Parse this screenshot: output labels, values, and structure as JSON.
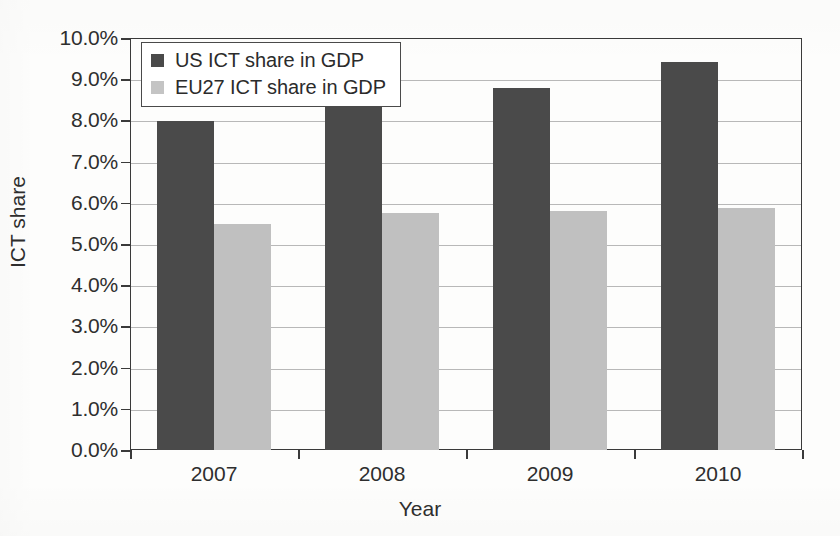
{
  "chart_data": {
    "type": "bar",
    "title": "",
    "subtitle": "",
    "xlabel": "Year",
    "ylabel": "ICT share",
    "categories": [
      "2007",
      "2008",
      "2009",
      "2010"
    ],
    "series": [
      {
        "name": "US ICT share in GDP",
        "color": "#4a4a4a",
        "values": [
          8.0,
          8.5,
          8.8,
          9.45
        ]
      },
      {
        "name": "EU27 ICT share in GDP",
        "color": "#c0c0c0",
        "values": [
          5.5,
          5.78,
          5.83,
          5.9
        ]
      }
    ],
    "ylim": [
      0,
      10
    ],
    "ytick_step": 1,
    "ytick_labels": [
      "0.0%",
      "1.0%",
      "2.0%",
      "3.0%",
      "4.0%",
      "5.0%",
      "6.0%",
      "7.0%",
      "8.0%",
      "9.0%",
      "10.0%"
    ],
    "value_unit": "percent",
    "grid": "horizontal",
    "legend_position": "top-left-inside"
  },
  "axes": {
    "y_title": "ICT share",
    "x_title": "Year"
  },
  "legend": {
    "entries": [
      {
        "label": "US ICT share in GDP",
        "swatch": "#4a4a4a"
      },
      {
        "label": "EU27 ICT share in GDP",
        "swatch": "#c4c4c4"
      }
    ]
  },
  "scan_artifacts": {
    "ghost_marks": [
      "",
      "",
      "",
      ""
    ]
  }
}
